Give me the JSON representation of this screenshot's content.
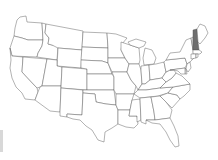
{
  "map": {
    "title": "",
    "region": "Contiguous United States",
    "style": "outline",
    "colors": {
      "background": "#ffffff",
      "outline": "#555555",
      "state_fill": "#ffffff",
      "highlight_fill": "#6e6e6e"
    },
    "highlighted_states": [
      "New Hampshire"
    ],
    "states": [
      "Washington",
      "Oregon",
      "California",
      "Idaho",
      "Nevada",
      "Montana",
      "Wyoming",
      "Utah",
      "Arizona",
      "Colorado",
      "New Mexico",
      "North Dakota",
      "South Dakota",
      "Nebraska",
      "Kansas",
      "Oklahoma",
      "Texas",
      "Minnesota",
      "Iowa",
      "Missouri",
      "Arkansas",
      "Louisiana",
      "Wisconsin",
      "Illinois",
      "Mississippi",
      "Michigan",
      "Indiana",
      "Kentucky",
      "Tennessee",
      "Alabama",
      "Ohio",
      "Georgia",
      "Florida",
      "South Carolina",
      "North Carolina",
      "Virginia",
      "West Virginia",
      "Pennsylvania",
      "New York",
      "Vermont",
      "New Hampshire",
      "Maine",
      "Massachusetts",
      "Connecticut",
      "Rhode Island",
      "New Jersey",
      "Delaware",
      "Maryland"
    ]
  }
}
